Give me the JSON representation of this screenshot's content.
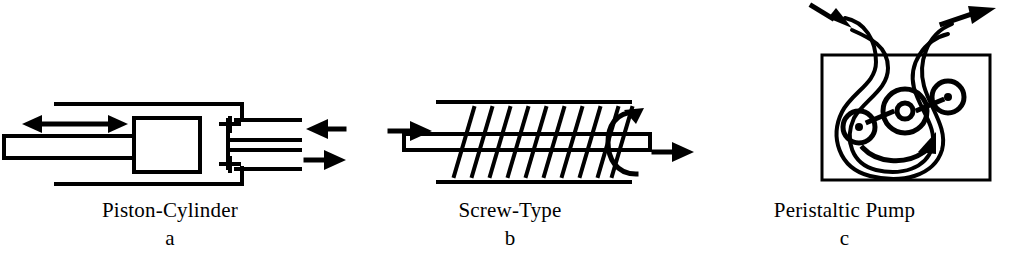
{
  "figure": {
    "type": "technical-line-diagram",
    "background_color": "#ffffff",
    "line_color": "#000000"
  },
  "panels": [
    {
      "id": "a",
      "title": "Piston-Cylinder",
      "letter": "a",
      "icon": "piston-cylinder-pump-icon",
      "parts": [
        {
          "name": "piston-rod",
          "label": ""
        },
        {
          "name": "piston-block",
          "label": ""
        },
        {
          "name": "cylinder-barrel",
          "label": ""
        },
        {
          "name": "inlet-port",
          "label": ""
        },
        {
          "name": "outlet-port",
          "label": ""
        },
        {
          "name": "inlet-check-valve",
          "label": ""
        },
        {
          "name": "outlet-check-valve",
          "label": ""
        }
      ],
      "arrows": [
        {
          "name": "reciprocating-motion-arrow",
          "direction": "double-horizontal"
        },
        {
          "name": "inlet-flow-arrow",
          "direction": "left"
        },
        {
          "name": "outlet-flow-arrow",
          "direction": "right"
        }
      ]
    },
    {
      "id": "b",
      "title": "Screw-Type",
      "letter": "b",
      "icon": "screw-type-pump-icon",
      "parts": [
        {
          "name": "barrel-wall-top",
          "label": ""
        },
        {
          "name": "barrel-wall-bottom",
          "label": ""
        },
        {
          "name": "screw-shaft",
          "label": ""
        },
        {
          "name": "helical-flight",
          "label": "",
          "turns": 11
        }
      ],
      "arrows": [
        {
          "name": "inlet-flow-arrow",
          "direction": "right"
        },
        {
          "name": "outlet-flow-arrow",
          "direction": "right"
        },
        {
          "name": "shaft-rotation-arrow",
          "direction": "circular"
        }
      ]
    },
    {
      "id": "c",
      "title": "Peristaltic Pump",
      "letter": "c",
      "icon": "peristaltic-pump-icon",
      "parts": [
        {
          "name": "pump-housing-box",
          "label": ""
        },
        {
          "name": "flexible-tube",
          "label": ""
        },
        {
          "name": "rotor-hub",
          "label": ""
        },
        {
          "name": "roller-left",
          "label": ""
        },
        {
          "name": "roller-right",
          "label": ""
        },
        {
          "name": "rotor-arm-left",
          "label": ""
        },
        {
          "name": "rotor-arm-right",
          "label": ""
        }
      ],
      "arrows": [
        {
          "name": "inlet-flow-arrow",
          "direction": "up-right"
        },
        {
          "name": "outlet-flow-arrow",
          "direction": "up-right"
        },
        {
          "name": "rotor-rotation-arrow",
          "direction": "clockwise"
        }
      ]
    }
  ]
}
